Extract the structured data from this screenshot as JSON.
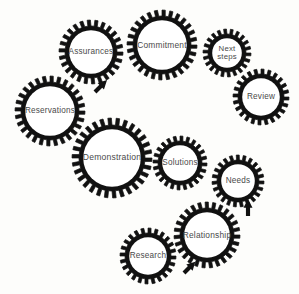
{
  "diagram": {
    "type": "gear-cycle-diagram",
    "background_color": "#fdfdfb",
    "gear_color": "#111111",
    "gear_fill_color": "#ffffff",
    "label_color": "#4a4a4a",
    "arrow_color": "#111111",
    "gears": [
      {
        "id": "assurances",
        "label": "Assurances",
        "cx": 91,
        "cy": 52,
        "outer_r": 32,
        "inner_r": 26,
        "teeth": 26,
        "font_size": 8.2
      },
      {
        "id": "commitment",
        "label": "Commitment",
        "cx": 162,
        "cy": 45,
        "outer_r": 35,
        "inner_r": 29,
        "teeth": 28,
        "font_size": 8.4
      },
      {
        "id": "next-steps",
        "label": "Next\nsteps",
        "cx": 227,
        "cy": 53,
        "outer_r": 24,
        "inner_r": 19,
        "teeth": 22,
        "font_size": 7.8
      },
      {
        "id": "review",
        "label": "Review",
        "cx": 261,
        "cy": 97,
        "outer_r": 28,
        "inner_r": 23,
        "teeth": 24,
        "font_size": 8.2
      },
      {
        "id": "reservations",
        "label": "Reservations",
        "cx": 50,
        "cy": 111,
        "outer_r": 35,
        "inner_r": 29,
        "teeth": 28,
        "font_size": 8.2
      },
      {
        "id": "demonstration",
        "label": "Demonstration",
        "cx": 112,
        "cy": 158,
        "outer_r": 40,
        "inner_r": 33,
        "teeth": 30,
        "font_size": 8.6
      },
      {
        "id": "solutions",
        "label": "Solutions",
        "cx": 180,
        "cy": 163,
        "outer_r": 27,
        "inner_r": 22,
        "teeth": 24,
        "font_size": 8.2
      },
      {
        "id": "needs",
        "label": "Needs",
        "cx": 238,
        "cy": 181,
        "outer_r": 26,
        "inner_r": 21,
        "teeth": 23,
        "font_size": 8.2
      },
      {
        "id": "relationship",
        "label": "Relationship",
        "cx": 207,
        "cy": 235,
        "outer_r": 33,
        "inner_r": 27,
        "teeth": 27,
        "font_size": 8.4
      },
      {
        "id": "research",
        "label": "Research",
        "cx": 148,
        "cy": 256,
        "outer_r": 28,
        "inner_r": 23,
        "teeth": 24,
        "font_size": 8.2
      }
    ],
    "arrows": [
      {
        "id": "arrow-reservations-to-assurances",
        "x": 95,
        "y": 92,
        "angle": -45,
        "length": 17,
        "width": 9
      },
      {
        "id": "arrow-to-needs",
        "x": 248,
        "y": 216,
        "angle": -90,
        "length": 17,
        "width": 9
      },
      {
        "id": "arrow-research-to-relationship",
        "x": 184,
        "y": 273,
        "angle": -45,
        "length": 16,
        "width": 9
      }
    ]
  }
}
